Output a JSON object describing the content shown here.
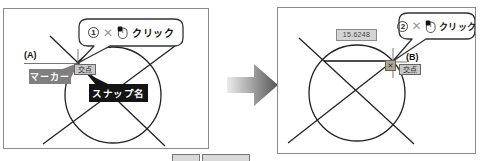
{
  "left": {
    "step_number": "1",
    "cursor_symbol": "✕",
    "click_label": "クリック",
    "point_label": "(A)",
    "marker_label": "マーカー",
    "snap_tooltip": "交点",
    "snap_name_label": "スナップ名"
  },
  "right": {
    "step_number": "2",
    "cursor_symbol": "✕",
    "click_label": "クリック",
    "point_label": "(B)",
    "snap_tooltip": "交点",
    "snap_marker_glyph": "✕",
    "dimension_value": "15.6248"
  },
  "colors": {
    "panel_border": "#8a8a8a",
    "drawing_line": "#222222",
    "marker_box_bg": "#7f7f7f",
    "snap_name_bg": "#141414",
    "tooltip_bg": "#c9c9c9",
    "arrow_gradient_start": "#ececec",
    "arrow_gradient_end": "#555555"
  },
  "icons": {
    "mouse": "mouse-left-click-icon",
    "arrow": "transition-arrow-icon"
  }
}
